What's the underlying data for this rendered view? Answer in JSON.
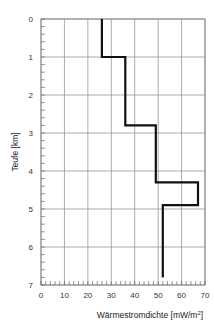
{
  "chart_data": {
    "type": "line",
    "subtype": "step-profile",
    "title": "",
    "xlabel": "Wärmestromdichte  [mW/m²]",
    "ylabel": "Teufe  [km]",
    "xlim": [
      0,
      70
    ],
    "ylim": [
      0,
      7
    ],
    "y_inverted": true,
    "grid": true,
    "x_ticks": [
      0,
      10,
      20,
      30,
      40,
      50,
      60,
      70
    ],
    "y_ticks": [
      0,
      1,
      2,
      3,
      4,
      5,
      6,
      7
    ],
    "series": [
      {
        "name": "Wärmestromdichte",
        "points": [
          {
            "depth": 0.0,
            "value": 26
          },
          {
            "depth": 1.0,
            "value": 26
          },
          {
            "depth": 1.0,
            "value": 36
          },
          {
            "depth": 2.8,
            "value": 36
          },
          {
            "depth": 2.8,
            "value": 49
          },
          {
            "depth": 4.3,
            "value": 49
          },
          {
            "depth": 4.3,
            "value": 67
          },
          {
            "depth": 4.9,
            "value": 67
          },
          {
            "depth": 4.9,
            "value": 52
          },
          {
            "depth": 6.8,
            "value": 52
          }
        ]
      }
    ]
  },
  "labels": {
    "xlabel_main": "Wärmestromdichte  [mW/m",
    "xlabel_sup": "2",
    "xlabel_end": "]",
    "ylabel": "Teufe  [km]"
  }
}
